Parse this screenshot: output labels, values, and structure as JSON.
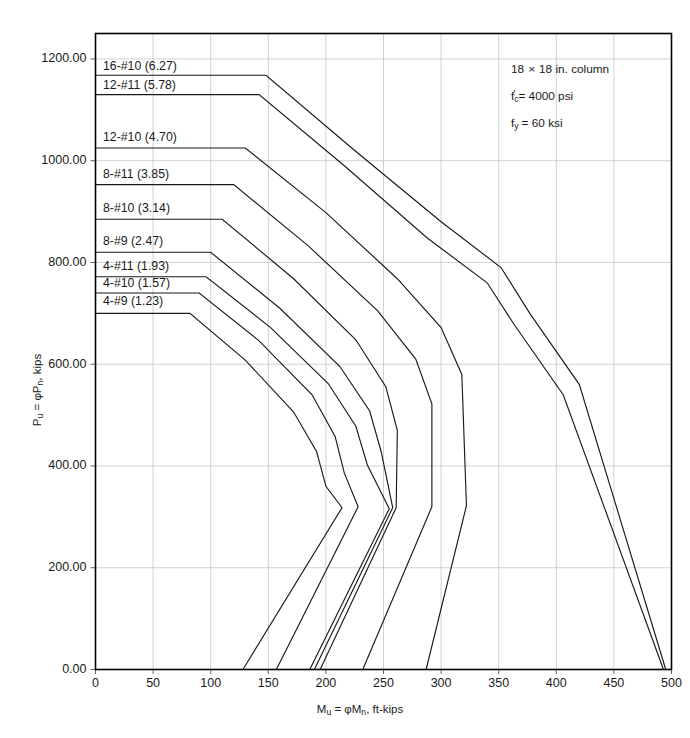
{
  "chart_data": {
    "type": "line",
    "title": "",
    "xlabel": "Mu = φMn, ft-kips",
    "ylabel": "Pu = φPn, kips",
    "xlim": [
      0,
      500
    ],
    "ylim": [
      0,
      1250
    ],
    "xticks": [
      0,
      50,
      100,
      150,
      200,
      250,
      300,
      350,
      400,
      450,
      500
    ],
    "xtick_labels": [
      "0",
      "50",
      "100",
      "150",
      "200",
      "250",
      "300",
      "350",
      "400",
      "450",
      "500"
    ],
    "yticks": [
      0,
      200,
      400,
      600,
      800,
      1000,
      1200
    ],
    "ytick_labels": [
      "0.00",
      "200.00",
      "400.00",
      "600.00",
      "800.00",
      "1000.00",
      "1200.00"
    ],
    "grid": true,
    "legend_position": "inline-left-labels",
    "series": [
      {
        "name": "16-#10 (6.27)",
        "label": "16-#10 (6.27)",
        "bars": "16-#10",
        "area_in2": 6.27,
        "label_x": 110,
        "label_y": 1185,
        "points": [
          [
            0,
            1168
          ],
          [
            148,
            1168
          ],
          [
            225,
            1020
          ],
          [
            300,
            880
          ],
          [
            352,
            790
          ],
          [
            377,
            700
          ],
          [
            420,
            560
          ],
          [
            495,
            0
          ]
        ]
      },
      {
        "name": "12-#11 (5.78)",
        "label": "12-#11 (5.78)",
        "bars": "12-#11",
        "area_in2": 5.78,
        "label_x": 110,
        "label_y": 1148,
        "points": [
          [
            0,
            1130
          ],
          [
            142,
            1130
          ],
          [
            216,
            990
          ],
          [
            288,
            848
          ],
          [
            340,
            760
          ],
          [
            364,
            676
          ],
          [
            406,
            540
          ],
          [
            493,
            0
          ]
        ]
      },
      {
        "name": "12-#10 (4.70)",
        "label": "12-#10 (4.70)",
        "bars": "12-#10",
        "area_in2": 4.7,
        "label_x": 110,
        "label_y": 1045,
        "points": [
          [
            0,
            1025
          ],
          [
            130,
            1025
          ],
          [
            200,
            898
          ],
          [
            262,
            768
          ],
          [
            300,
            672
          ],
          [
            318,
            580
          ],
          [
            322,
            322
          ],
          [
            287,
            0
          ]
        ]
      },
      {
        "name": "8-#11 (3.85)",
        "label": "8-#11 (3.85)",
        "bars": "8-#11",
        "area_in2": 3.85,
        "label_x": 110,
        "label_y": 972,
        "points": [
          [
            0,
            953
          ],
          [
            120,
            953
          ],
          [
            185,
            832
          ],
          [
            245,
            705
          ],
          [
            278,
            610
          ],
          [
            292,
            522
          ],
          [
            292,
            320
          ],
          [
            232,
            0
          ]
        ]
      },
      {
        "name": "8-#10 (3.14)",
        "label": "8-#10 (3.14)",
        "bars": "8-#10",
        "area_in2": 3.14,
        "label_x": 110,
        "label_y": 905,
        "points": [
          [
            0,
            885
          ],
          [
            110,
            885
          ],
          [
            172,
            768
          ],
          [
            226,
            648
          ],
          [
            252,
            556
          ],
          [
            262,
            470
          ],
          [
            261,
            318
          ],
          [
            195,
            0
          ]
        ]
      },
      {
        "name": "8-#9 (2.47)",
        "label": "8-#9 (2.47)",
        "bars": "8-#9",
        "area_in2": 2.47,
        "label_x": 110,
        "label_y": 840,
        "points": [
          [
            0,
            820
          ],
          [
            100,
            820
          ],
          [
            160,
            710
          ],
          [
            212,
            596
          ],
          [
            238,
            508
          ],
          [
            248,
            428
          ],
          [
            258,
            318
          ],
          [
            190,
            0
          ]
        ]
      },
      {
        "name": "4-#11 (1.93)",
        "label": "4-#11 (1.93)",
        "bars": "4-#11",
        "area_in2": 1.93,
        "label_x": 110,
        "label_y": 792,
        "points": [
          [
            0,
            772
          ],
          [
            96,
            772
          ],
          [
            152,
            672
          ],
          [
            202,
            562
          ],
          [
            226,
            478
          ],
          [
            236,
            402
          ],
          [
            255,
            316
          ],
          [
            186,
            0
          ]
        ]
      },
      {
        "name": "4-#10 (1.57)",
        "label": "4-#10 (1.57)",
        "bars": "4-#10",
        "area_in2": 1.57,
        "label_x": 110,
        "label_y": 758,
        "points": [
          [
            0,
            740
          ],
          [
            90,
            740
          ],
          [
            142,
            646
          ],
          [
            188,
            540
          ],
          [
            208,
            458
          ],
          [
            216,
            386
          ],
          [
            228,
            320
          ],
          [
            157,
            0
          ]
        ]
      },
      {
        "name": "4-#9 (1.23)",
        "label": "4-#9 (1.23)",
        "bars": "4-#9",
        "area_in2": 1.23,
        "label_x": 110,
        "label_y": 722,
        "points": [
          [
            0,
            700
          ],
          [
            82,
            700
          ],
          [
            130,
            608
          ],
          [
            172,
            506
          ],
          [
            192,
            428
          ],
          [
            200,
            360
          ],
          [
            214,
            318
          ],
          [
            128,
            0
          ]
        ]
      }
    ],
    "annotations": [
      {
        "text": "18 × 18 in. column",
        "x": 350,
        "y": 1155
      },
      {
        "text": "f'c = 4000 psi",
        "x": 350,
        "y": 1100
      },
      {
        "text": "fy = 60 ksi",
        "x": 350,
        "y": 1045
      }
    ]
  },
  "notes": {
    "line1_plain": "18",
    "line1_times": "×",
    "line1_rest": "18 in. column",
    "line2_f": "f",
    "line2_sub": "c",
    "line2_prime": "'",
    "line2_rest": "= 4000 psi",
    "line3_f": "f",
    "line3_sub": "y",
    "line3_rest": "= 60 ksi"
  },
  "axis_titles": {
    "y_p": "P",
    "y_sub_u": "u",
    "y_eq": " = ",
    "y_phi": "φP",
    "y_sub_n": "n",
    "y_unit": ", kips",
    "x_m": "M",
    "x_sub_u": "u",
    "x_eq": " = ",
    "x_phi": "φM",
    "x_sub_n": "n",
    "x_unit": ", ft-kips"
  },
  "colors": {
    "curve": "#1a1a1a",
    "grid": "#bdbdbd",
    "frame": "#000000",
    "background": "#ffffff"
  }
}
